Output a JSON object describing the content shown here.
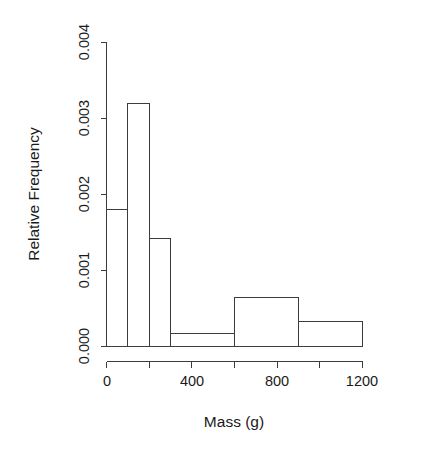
{
  "chart_data": {
    "type": "bar",
    "title": "",
    "subtitle": "",
    "xlabel": "Mass (g)",
    "ylabel": "Relative Frequency",
    "grid": false,
    "legend": "none",
    "histogram": true,
    "bin_edges": [
      0,
      100,
      200,
      300,
      600,
      900,
      1200
    ],
    "categories": [
      "0-100",
      "100-200",
      "200-300",
      "300-600",
      "600-900",
      "900-1200"
    ],
    "values": [
      0.0018,
      0.0032,
      0.00142,
      0.00017,
      0.00065,
      0.00033
    ],
    "bars": [
      {
        "x0": 0,
        "x1": 100,
        "density": 0.0018
      },
      {
        "x0": 100,
        "x1": 200,
        "density": 0.0032
      },
      {
        "x0": 200,
        "x1": 300,
        "density": 0.00142
      },
      {
        "x0": 300,
        "x1": 600,
        "density": 0.00017
      },
      {
        "x0": 600,
        "x1": 900,
        "density": 0.00065
      },
      {
        "x0": 900,
        "x1": 1200,
        "density": 0.00033
      }
    ],
    "xlim": [
      0,
      1200
    ],
    "ylim": [
      0.0,
      0.004
    ],
    "x_ticks": [
      0,
      200,
      400,
      600,
      800,
      1000,
      1200
    ],
    "x_tick_labels": [
      "0",
      "",
      "400",
      "",
      "800",
      "",
      "1200"
    ],
    "y_ticks": [
      0.0,
      0.001,
      0.002,
      0.003,
      0.004
    ],
    "y_tick_labels": [
      "0.000",
      "0.001",
      "0.002",
      "0.003",
      "0.004"
    ],
    "colors": {
      "bar_fill": "#ffffff",
      "bar_stroke": "#3c3c3c",
      "axis": "#3c3c3c",
      "text": "#1a1a1a",
      "background": "#ffffff"
    }
  },
  "axes": {
    "y": {
      "title": "Relative Frequency",
      "ticks": [
        {
          "label": "0.004",
          "value": 0.004
        },
        {
          "label": "0.003",
          "value": 0.003
        },
        {
          "label": "0.002",
          "value": 0.002
        },
        {
          "label": "0.001",
          "value": 0.001
        },
        {
          "label": "0.000",
          "value": 0.0
        }
      ]
    },
    "x": {
      "title": "Mass (g)",
      "ticks": [
        {
          "label": "0",
          "value": 0
        },
        {
          "label": "400",
          "value": 400
        },
        {
          "label": "800",
          "value": 800
        },
        {
          "label": "1200",
          "value": 1200
        }
      ]
    }
  }
}
